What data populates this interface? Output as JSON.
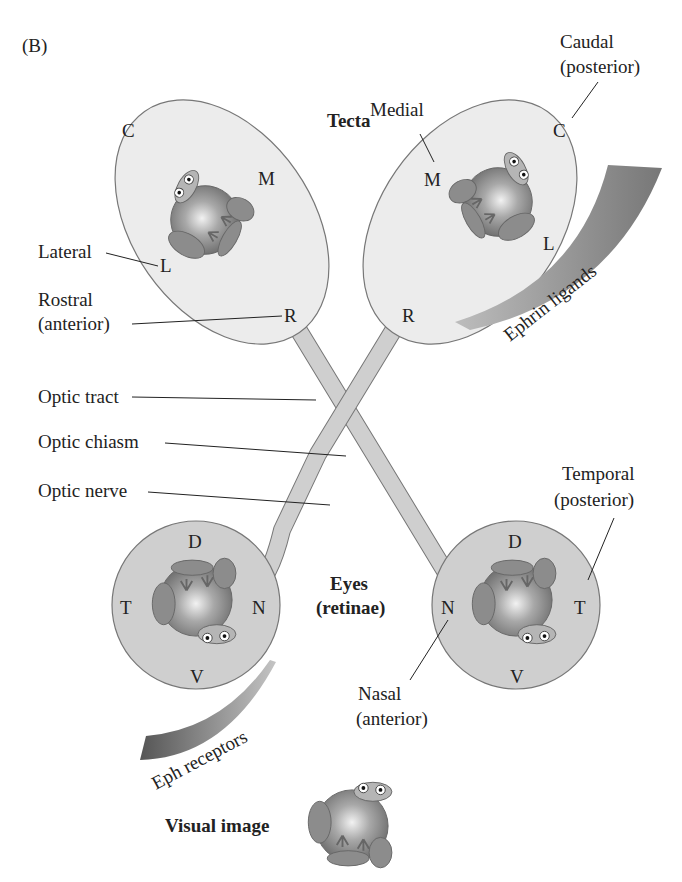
{
  "panel_label": "(B)",
  "tecta": {
    "title": "Tecta",
    "left": {
      "C": "C",
      "M": "M",
      "L": "L",
      "R": "R"
    },
    "right": {
      "C": "C",
      "M": "M",
      "L": "L",
      "R": "R"
    },
    "labels": {
      "lateral": "Lateral",
      "rostral_1": "Rostral",
      "rostral_2": "(anterior)",
      "medial": "Medial",
      "caudal_1": "Caudal",
      "caudal_2": "(posterior)"
    },
    "gradient_label": "Ephrin ligands"
  },
  "pathway": {
    "optic_tract": "Optic tract",
    "optic_chiasm": "Optic chiasm",
    "optic_nerve": "Optic nerve"
  },
  "eyes": {
    "title_1": "Eyes",
    "title_2": "(retinae)",
    "left": {
      "D": "D",
      "T": "T",
      "N": "N",
      "V": "V"
    },
    "right": {
      "D": "D",
      "T": "T",
      "N": "N",
      "V": "V"
    },
    "labels": {
      "temporal_1": "Temporal",
      "temporal_2": "(posterior)",
      "nasal_1": "Nasal",
      "nasal_2": "(anterior)"
    },
    "gradient_label": "Eph receptors"
  },
  "visual_image_label": "Visual image",
  "colors": {
    "tectum_fill": "#ebebeb",
    "eye_fill": "#cfcfcf",
    "nerve_fill": "#c9c9c9",
    "gradient_dark": "#6f6f6f",
    "gradient_light": "#bdbdbd",
    "frog": "#9a9a9a"
  }
}
